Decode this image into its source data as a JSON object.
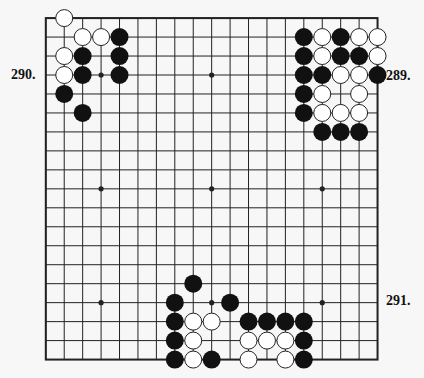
{
  "diagram": {
    "type": "go-board",
    "size": 19,
    "colors": {
      "background": "#f7f7f7",
      "line": "#222222",
      "black_stone": "#111111",
      "white_stone": "#ffffff"
    },
    "hoshi": [
      [
        3,
        3
      ],
      [
        9,
        3
      ],
      [
        15,
        3
      ],
      [
        3,
        9
      ],
      [
        9,
        9
      ],
      [
        15,
        9
      ],
      [
        3,
        15
      ],
      [
        9,
        15
      ],
      [
        15,
        15
      ]
    ],
    "black_stones": [
      [
        4,
        1
      ],
      [
        2,
        2
      ],
      [
        4,
        2
      ],
      [
        2,
        3
      ],
      [
        4,
        3
      ],
      [
        1,
        4
      ],
      [
        2,
        5
      ],
      [
        14,
        1
      ],
      [
        16,
        1
      ],
      [
        14,
        2
      ],
      [
        16,
        2
      ],
      [
        17,
        2
      ],
      [
        14,
        3
      ],
      [
        15,
        3
      ],
      [
        18,
        3
      ],
      [
        14,
        4
      ],
      [
        14,
        5
      ],
      [
        15,
        6
      ],
      [
        16,
        6
      ],
      [
        17,
        6
      ],
      [
        8,
        14
      ],
      [
        7,
        15
      ],
      [
        10,
        15
      ],
      [
        7,
        16
      ],
      [
        11,
        16
      ],
      [
        12,
        16
      ],
      [
        13,
        16
      ],
      [
        14,
        16
      ],
      [
        7,
        17
      ],
      [
        14,
        17
      ],
      [
        7,
        18
      ],
      [
        9,
        18
      ],
      [
        14,
        18
      ]
    ],
    "white_stones": [
      [
        1,
        0
      ],
      [
        2,
        1
      ],
      [
        3,
        1
      ],
      [
        1,
        2
      ],
      [
        1,
        3
      ],
      [
        15,
        1
      ],
      [
        17,
        1
      ],
      [
        18,
        1
      ],
      [
        15,
        2
      ],
      [
        18,
        2
      ],
      [
        16,
        3
      ],
      [
        17,
        3
      ],
      [
        15,
        4
      ],
      [
        17,
        4
      ],
      [
        15,
        5
      ],
      [
        16,
        5
      ],
      [
        17,
        5
      ],
      [
        8,
        16
      ],
      [
        9,
        16
      ],
      [
        8,
        17
      ],
      [
        11,
        17
      ],
      [
        12,
        17
      ],
      [
        13,
        17
      ],
      [
        8,
        18
      ],
      [
        11,
        18
      ],
      [
        13,
        18
      ]
    ]
  },
  "labels": {
    "problem_289": "289.",
    "problem_290": "290.",
    "problem_291": "291."
  }
}
